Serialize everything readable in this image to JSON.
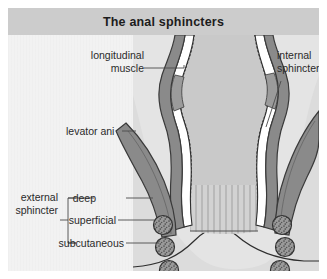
{
  "figure": {
    "title": "The anal sphincters",
    "background_color": "#f2f2f2",
    "title_band_color": "#cccccc",
    "title_text_color": "#1c1c1c",
    "label_text_color": "#2a2a2a",
    "leader_line_color": "#4a4a4a"
  },
  "colors": {
    "lumen_fill": "#c9c9c9",
    "mucosa_fill": "#d2d2d2",
    "muscle_fill": "#8a8a8a",
    "muscle_outline": "#3a3a3a",
    "wall_outline": "#2e2e2e",
    "bundle_fill": "#9a9a9a",
    "bundle_outline": "#333333",
    "skin_fill": "#ededed",
    "tissue_fill": "#dcdcdc"
  },
  "labels": {
    "longitudinal_muscle": {
      "line1": "longitudinal",
      "line2": "muscle"
    },
    "levator_ani": "levator ani",
    "internal_sphincter": {
      "line1": "internal",
      "line2": "sphincter"
    },
    "external_sphincter": {
      "line1": "external",
      "line2": "sphincter"
    },
    "deep": "deep",
    "superficial": "superficial",
    "subcutaneous": "subcutaneous"
  },
  "structures": [
    {
      "name": "longitudinal-muscle",
      "side": "left"
    },
    {
      "name": "levator-ani",
      "side": "left"
    },
    {
      "name": "internal-sphincter",
      "side": "right"
    },
    {
      "name": "external-sphincter-deep",
      "side": "both"
    },
    {
      "name": "external-sphincter-superficial",
      "side": "both"
    },
    {
      "name": "external-sphincter-subcutaneous",
      "side": "both"
    }
  ],
  "muscle_bundles": {
    "left": [
      {
        "label_key": "deep",
        "cx": 155,
        "cy": 190
      },
      {
        "label_key": "superficial",
        "cx": 157,
        "cy": 212
      },
      {
        "label_key": "subcutaneous",
        "cx": 161,
        "cy": 235
      }
    ],
    "right": [
      {
        "label_key": "deep",
        "cx": 274,
        "cy": 190
      },
      {
        "label_key": "superficial",
        "cx": 277,
        "cy": 212
      },
      {
        "label_key": "subcutaneous",
        "cx": 272,
        "cy": 235
      }
    ]
  }
}
